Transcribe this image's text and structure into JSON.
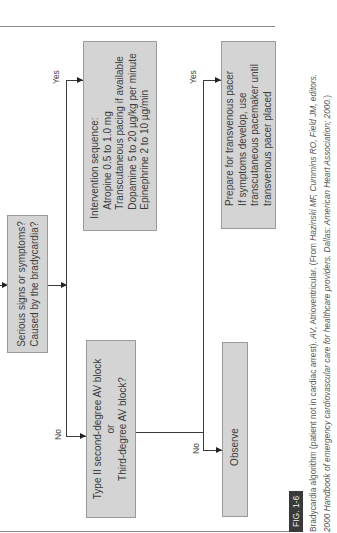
{
  "diagram": {
    "title": "Bradycardia algorithm",
    "nodes": {
      "serious": {
        "lines": [
          "Serious signs or symptoms?",
          "Caused by the bradycardia?"
        ]
      },
      "intervention": {
        "lines": [
          "Intervention sequence:",
          "Atropine 0.5 to 1.0 mg",
          "Transcutaneous pacing if available",
          "Dopamine 5 to 20 µg/kg per minute",
          "Epinephrine 2 to 10 µg/min"
        ]
      },
      "avblock": {
        "lines": [
          "Type II second-degree AV block",
          "or",
          "Third-degree AV block?"
        ]
      },
      "prepare": {
        "lines": [
          "Prepare for transvenous pacer",
          "If symptoms develop, use",
          "transcutaneous pacemaker until",
          "transvenous pacer placed"
        ]
      },
      "observe": {
        "lines": [
          "Observe"
        ]
      }
    },
    "edge_labels": {
      "serious_yes": "Yes",
      "serious_no": "No",
      "avblock_yes": "Yes",
      "avblock_no": "No"
    }
  },
  "caption": {
    "fig_label": "FIG. 1-6",
    "line1_plain": "Bradycardia algorithm (patient not in cardiac arrest). ",
    "line1_abbr": "AV,",
    "line1_rest": " Atrioventricular.   (From ",
    "line1_source": "Hazinski MF, Cummins RO, Field JM, editors.",
    "line2_source": "2000 Handbook of emergency cardiovascular care for healthcare providers. Dallas: American Heart Association; 2000.",
    "line2_end": ")"
  },
  "colors": {
    "box_fill": "#d4d4d4",
    "box_border": "#9a9a9a",
    "line": "#3a3a3a",
    "fig_tag_bg": "#3a3a3a"
  }
}
